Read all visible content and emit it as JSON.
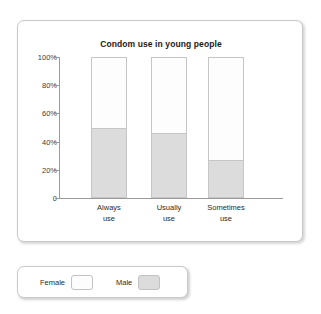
{
  "chart_data": {
    "type": "bar",
    "subtype": "stacked-100-percent",
    "title": "Condom use in young people",
    "xlabel": "",
    "ylabel": "",
    "categories": [
      "Always use",
      "Usually use",
      "Sometimes use"
    ],
    "category_lines": [
      [
        "Always",
        "use"
      ],
      [
        "Usually",
        "use"
      ],
      [
        "Sometimes",
        "use"
      ]
    ],
    "series": [
      {
        "name": "Male",
        "values": [
          50,
          46,
          27
        ],
        "color": "#dcdcdc"
      },
      {
        "name": "Female",
        "values": [
          50,
          54,
          73
        ],
        "color": "#fdfdfd"
      }
    ],
    "ylim": [
      0,
      100
    ],
    "yticks": [
      0,
      20,
      40,
      60,
      80,
      100
    ],
    "ytick_labels": [
      "0",
      "20%",
      "40%",
      "60%",
      "80%",
      "100%"
    ],
    "grid": false,
    "legend_position": "below-chart"
  },
  "legend": {
    "entries": [
      {
        "label": "Female",
        "color": "#fdfdfd"
      },
      {
        "label": "Male",
        "color": "#dcdcdc"
      }
    ]
  }
}
